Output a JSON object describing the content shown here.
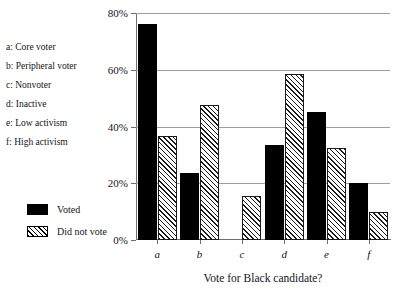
{
  "chart_data": {
    "type": "bar",
    "title": "",
    "xlabel": "Vote for Black candidate?",
    "ylabel": "",
    "ylim": [
      0,
      80
    ],
    "grid": true,
    "legend_position": "left",
    "categories": [
      "a",
      "b",
      "c",
      "d",
      "e",
      "f"
    ],
    "category_key": [
      "a: Core voter",
      "b: Peripheral voter",
      "c: Nonvoter",
      "d: Inactive",
      "e: Low activism",
      "f: High activism"
    ],
    "ytick_labels": [
      "0%",
      "20%",
      "40%",
      "60%",
      "80%"
    ],
    "ytick_values": [
      0,
      20,
      40,
      60,
      80
    ],
    "series": [
      {
        "name": "Voted",
        "pattern": "solid",
        "values": [
          76,
          23.5,
          null,
          33.5,
          45,
          20
        ]
      },
      {
        "name": "Did not vote",
        "pattern": "hatched",
        "values": [
          36.5,
          47.5,
          15.5,
          58.5,
          32.5,
          10
        ]
      }
    ]
  },
  "colors": {
    "voted": "#000000",
    "did_not_vote_line": "#1a1a1a",
    "gridline": "#9d9d9d",
    "axis": "#6f6f6f",
    "background": "#ffffff",
    "text": "#141414"
  }
}
